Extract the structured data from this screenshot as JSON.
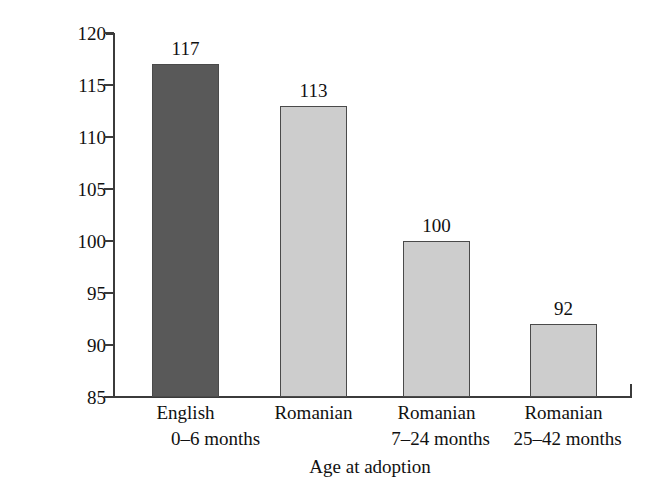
{
  "chart_data": {
    "type": "bar",
    "title": "",
    "xlabel": "Age at adoption",
    "ylabel": "IQ score at age 6",
    "categories": [
      "English",
      "Romanian",
      "Romanian",
      "Romanian"
    ],
    "category_sublabels": [
      "0–6 months",
      "7–24 months",
      "25–42 months",
      ""
    ],
    "category_lines": [
      [
        "English",
        "0–6 months"
      ],
      [
        "Romanian",
        ""
      ],
      [
        "Romanian",
        "7–24 months"
      ],
      [
        "Romanian",
        "25–42 months"
      ]
    ],
    "values": [
      117,
      113,
      100,
      92
    ],
    "value_labels": [
      "117",
      "113",
      "100",
      "92"
    ],
    "ylim": [
      85,
      120
    ],
    "yticks": [
      85,
      90,
      95,
      100,
      105,
      110,
      115,
      120
    ],
    "ytick_labels": [
      "85",
      "90",
      "95",
      "100",
      "105",
      "110",
      "115",
      "120"
    ],
    "grid": false,
    "legend": false,
    "bar_colors": [
      "#595959",
      "#cdcdcd",
      "#cdcdcd",
      "#cdcdcd"
    ],
    "bar_border_color": "#4a4a4a",
    "axis_color": "#3b3b3b",
    "background_color": "#ffffff",
    "text_color": "#111111"
  }
}
